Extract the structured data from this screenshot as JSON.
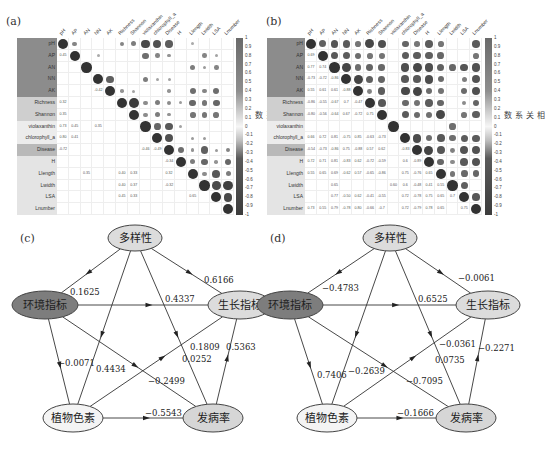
{
  "panels": {
    "a": {
      "label": "(a)"
    },
    "b": {
      "label": "(b)"
    },
    "c": {
      "label": "(c)"
    },
    "d": {
      "label": "(d)"
    }
  },
  "heatmap": {
    "variables": [
      "pH",
      "AP",
      "AN",
      "NN",
      "AK",
      "Richness",
      "Shannon",
      "violaxanthin",
      "chlorophyll_a",
      "Disease",
      "H",
      "Llength",
      "Lwidth",
      "LSA",
      "Lnumber"
    ],
    "row_groups": [
      {
        "rows": [
          0,
          1,
          2,
          3,
          4
        ],
        "color": "#8c8c8c"
      },
      {
        "rows": [
          5,
          6
        ],
        "color": "#cfcfcf"
      },
      {
        "rows": [
          7,
          8
        ],
        "color": "#ececec"
      },
      {
        "rows": [
          9
        ],
        "color": "#b9b9b9"
      },
      {
        "rows": [
          10,
          11,
          12,
          13,
          14
        ],
        "color": "#e4e4e4"
      }
    ],
    "colorbar": {
      "title": "相关系数",
      "ticks": [
        "1",
        "0.9",
        "0.8",
        "0.7",
        "0.6",
        "0.5",
        "0.4",
        "0.3",
        "0.2",
        "0.1",
        "0",
        "-0.1",
        "-0.2",
        "-0.3",
        "-0.4",
        "-0.5",
        "-0.6",
        "-0.7",
        "-0.8",
        "-0.9",
        "-1"
      ]
    }
  },
  "chart_data": [
    {
      "type": "heatmap",
      "title": "(a) correlation matrix",
      "variables": [
        "pH",
        "AP",
        "AN",
        "NN",
        "AK",
        "Richness",
        "Shannon",
        "violaxanthin",
        "chlorophyll_a",
        "Disease",
        "H",
        "Llength",
        "Lwidth",
        "LSA",
        "Lnumber"
      ],
      "legend": "相关系数",
      "range": [
        -1,
        1
      ],
      "upper_circles": [
        [
          0,
          0,
          1.0
        ],
        [
          0,
          1,
          0.45
        ],
        [
          0,
          5,
          0.45
        ],
        [
          0,
          6,
          0.5
        ],
        [
          0,
          7,
          0.85
        ],
        [
          0,
          8,
          0.8
        ],
        [
          0,
          9,
          -0.72
        ],
        [
          0,
          11,
          0.2
        ],
        [
          1,
          1,
          1.0
        ],
        [
          1,
          3,
          0.2
        ],
        [
          1,
          7,
          0.6
        ],
        [
          1,
          8,
          0.45
        ],
        [
          1,
          9,
          0.35
        ],
        [
          1,
          12,
          0.45
        ],
        [
          1,
          13,
          0.25
        ],
        [
          2,
          2,
          1.0
        ],
        [
          2,
          11,
          0.5
        ],
        [
          2,
          12,
          0.3
        ],
        [
          2,
          13,
          0.45
        ],
        [
          3,
          3,
          1.0
        ],
        [
          3,
          4,
          -0.7
        ],
        [
          3,
          7,
          0.5
        ],
        [
          3,
          8,
          0.25
        ],
        [
          3,
          9,
          0.25
        ],
        [
          4,
          4,
          1.0
        ],
        [
          4,
          5,
          0.35
        ],
        [
          4,
          6,
          0.25
        ],
        [
          4,
          9,
          0.35
        ],
        [
          4,
          11,
          0.6
        ],
        [
          4,
          12,
          0.45
        ],
        [
          4,
          13,
          0.6
        ],
        [
          5,
          5,
          1.0
        ],
        [
          5,
          6,
          0.95
        ],
        [
          5,
          7,
          0.4
        ],
        [
          5,
          8,
          0.5
        ],
        [
          5,
          9,
          0.4
        ],
        [
          5,
          10,
          0.3
        ],
        [
          5,
          11,
          0.65
        ],
        [
          5,
          12,
          0.55
        ],
        [
          5,
          13,
          0.65
        ],
        [
          6,
          6,
          1.0
        ],
        [
          6,
          7,
          0.4
        ],
        [
          6,
          8,
          0.5
        ],
        [
          6,
          9,
          0.35
        ],
        [
          6,
          11,
          0.55
        ],
        [
          6,
          12,
          0.55
        ],
        [
          6,
          13,
          0.55
        ],
        [
          7,
          7,
          1.0
        ],
        [
          7,
          8,
          0.65
        ],
        [
          7,
          9,
          -0.75
        ],
        [
          7,
          10,
          0.25
        ],
        [
          8,
          8,
          1.0
        ],
        [
          8,
          9,
          -0.8
        ],
        [
          8,
          11,
          0.3
        ],
        [
          8,
          12,
          0.3
        ],
        [
          9,
          9,
          1.0
        ],
        [
          9,
          10,
          0.6
        ],
        [
          9,
          11,
          0.35
        ],
        [
          9,
          12,
          -0.7
        ],
        [
          9,
          13,
          0.3
        ],
        [
          9,
          14,
          0.45
        ],
        [
          10,
          10,
          1.0
        ],
        [
          10,
          11,
          0.5
        ],
        [
          10,
          12,
          -0.65
        ],
        [
          10,
          13,
          0.35
        ],
        [
          10,
          14,
          0.65
        ],
        [
          11,
          11,
          1.0
        ],
        [
          11,
          12,
          0.4
        ],
        [
          11,
          13,
          0.75
        ],
        [
          11,
          14,
          0.5
        ],
        [
          12,
          12,
          1.0
        ],
        [
          12,
          13,
          0.83
        ],
        [
          12,
          14,
          -0.9
        ],
        [
          13,
          13,
          1.0
        ],
        [
          13,
          14,
          0.85
        ],
        [
          14,
          14,
          1.0
        ]
      ],
      "lower_values": [
        [
          1,
          0,
          "0.45"
        ],
        [
          4,
          3,
          "-0.42"
        ],
        [
          5,
          0,
          "0.32"
        ],
        [
          6,
          0,
          "0.35"
        ],
        [
          7,
          0,
          "0.73"
        ],
        [
          7,
          1,
          "0.45"
        ],
        [
          7,
          3,
          "0.35"
        ],
        [
          8,
          0,
          "0.80"
        ],
        [
          8,
          1,
          "0.41"
        ],
        [
          9,
          0,
          "-0.72"
        ],
        [
          9,
          7,
          "-0.46"
        ],
        [
          9,
          8,
          "-0.49"
        ],
        [
          10,
          9,
          "-0.34"
        ],
        [
          11,
          2,
          "0.35"
        ],
        [
          11,
          5,
          "0.40"
        ],
        [
          11,
          6,
          "0.33"
        ],
        [
          11,
          9,
          "0.32"
        ],
        [
          12,
          5,
          "0.40"
        ],
        [
          12,
          6,
          "0.37"
        ],
        [
          12,
          9,
          "-0.32"
        ],
        [
          13,
          5,
          "0.45"
        ],
        [
          13,
          6,
          "0.33"
        ],
        [
          13,
          11,
          "0.65"
        ]
      ]
    },
    {
      "type": "heatmap",
      "title": "(b) correlation matrix",
      "variables": [
        "pH",
        "AP",
        "AN",
        "NN",
        "AK",
        "Richness",
        "Shannon",
        "violaxanthin",
        "chlorophyll_a",
        "Disease",
        "H",
        "Llength",
        "Lwidth",
        "LSA",
        "Lnumber"
      ],
      "legend": "相关系数",
      "range": [
        -1,
        1
      ],
      "lower_values": [
        [
          1,
          0,
          "0.69"
        ],
        [
          2,
          0,
          "0.77"
        ],
        [
          2,
          1,
          "0.74"
        ],
        [
          3,
          0,
          "-0.73"
        ],
        [
          3,
          1,
          "-0.72"
        ],
        [
          3,
          2,
          "-0.86"
        ],
        [
          4,
          0,
          "0.55"
        ],
        [
          4,
          1,
          "0.61"
        ],
        [
          4,
          2,
          "0.61"
        ],
        [
          4,
          3,
          "-0.88"
        ],
        [
          5,
          0,
          "-0.86"
        ],
        [
          5,
          1,
          "-0.55"
        ],
        [
          5,
          2,
          "-0.67"
        ],
        [
          5,
          3,
          "0.7"
        ],
        [
          5,
          4,
          "-0.47"
        ],
        [
          6,
          0,
          "-0.80"
        ],
        [
          6,
          1,
          "-0.56"
        ],
        [
          6,
          2,
          "-0.64"
        ],
        [
          6,
          3,
          "0.67"
        ],
        [
          6,
          4,
          "-0.72"
        ],
        [
          6,
          5,
          "0.75"
        ],
        [
          8,
          0,
          "0.66"
        ],
        [
          8,
          1,
          "0.72"
        ],
        [
          8,
          2,
          "0.81"
        ],
        [
          8,
          3,
          "-0.75"
        ],
        [
          8,
          4,
          "0.85"
        ],
        [
          8,
          5,
          "-0.63"
        ],
        [
          8,
          6,
          "-0.73"
        ],
        [
          9,
          0,
          "-0.54"
        ],
        [
          9,
          1,
          "-0.73"
        ],
        [
          9,
          2,
          "-0.86"
        ],
        [
          9,
          3,
          "0.75"
        ],
        [
          9,
          4,
          "-0.88"
        ],
        [
          9,
          5,
          "0.57"
        ],
        [
          9,
          6,
          "0.62"
        ],
        [
          9,
          8,
          "-0.83"
        ],
        [
          10,
          0,
          "0.72"
        ],
        [
          10,
          1,
          "0.71"
        ],
        [
          10,
          2,
          "0.81"
        ],
        [
          10,
          3,
          "-0.83"
        ],
        [
          10,
          4,
          "0.62"
        ],
        [
          10,
          5,
          "-0.72"
        ],
        [
          10,
          6,
          "-0.59"
        ],
        [
          10,
          8,
          "0.6"
        ],
        [
          10,
          9,
          "-0.89"
        ],
        [
          11,
          0,
          "0.55"
        ],
        [
          11,
          1,
          "0.65"
        ],
        [
          11,
          2,
          "0.69"
        ],
        [
          11,
          3,
          "-0.62"
        ],
        [
          11,
          4,
          "0.57"
        ],
        [
          11,
          5,
          "-0.65"
        ],
        [
          11,
          6,
          "-0.86"
        ],
        [
          11,
          8,
          "0.75"
        ],
        [
          11,
          9,
          "-0.76"
        ],
        [
          11,
          10,
          "0.65"
        ],
        [
          12,
          2,
          "0.65"
        ],
        [
          12,
          7,
          "0.60"
        ],
        [
          12,
          8,
          "0.6"
        ],
        [
          12,
          9,
          "-0.48"
        ],
        [
          12,
          10,
          "0.41"
        ],
        [
          12,
          11,
          "0.55"
        ],
        [
          13,
          2,
          "0.77"
        ],
        [
          13,
          3,
          "-0.50"
        ],
        [
          13,
          4,
          "0.62"
        ],
        [
          13,
          5,
          "-0.41"
        ],
        [
          13,
          6,
          "-0.55"
        ],
        [
          13,
          8,
          "0.72"
        ],
        [
          13,
          9,
          "-0.78"
        ],
        [
          13,
          10,
          "0.75"
        ],
        [
          13,
          11,
          "0.65"
        ],
        [
          13,
          12,
          "0.7"
        ],
        [
          14,
          0,
          "0.73"
        ],
        [
          14,
          1,
          "0.55"
        ],
        [
          14,
          2,
          "0.79"
        ],
        [
          14,
          3,
          "-0.78"
        ],
        [
          14,
          4,
          "0.80"
        ],
        [
          14,
          5,
          "-0.66"
        ],
        [
          14,
          6,
          "-0.7"
        ],
        [
          14,
          8,
          "0.72"
        ],
        [
          14,
          9,
          "-0.79"
        ],
        [
          14,
          10,
          "0.78"
        ],
        [
          14,
          11,
          "0.65"
        ],
        [
          14,
          13,
          "0.75"
        ]
      ]
    }
  ],
  "diagrams": {
    "c": {
      "nodes": [
        {
          "id": "div",
          "label": "多样性",
          "cx": 135,
          "cy": 238,
          "rx": 27,
          "ry": 13,
          "fill": "#dcdcdc"
        },
        {
          "id": "env",
          "label": "环境指标",
          "cx": 45,
          "cy": 305,
          "rx": 33,
          "ry": 14,
          "fill": "#7d7d7d"
        },
        {
          "id": "grow",
          "label": "生长指标",
          "cx": 240,
          "cy": 305,
          "rx": 32,
          "ry": 14,
          "fill": "#dcdcdc"
        },
        {
          "id": "pig",
          "label": "植物色素",
          "cx": 73,
          "cy": 418,
          "rx": 30,
          "ry": 14,
          "fill": "#f4f4f4"
        },
        {
          "id": "dis",
          "label": "发病率",
          "cx": 213,
          "cy": 418,
          "rx": 30,
          "ry": 14,
          "fill": "#d6d6d6"
        }
      ],
      "edges": [
        {
          "from": "div",
          "to": "env",
          "value": "0.1625",
          "lx": 70,
          "ly": 295
        },
        {
          "from": "div",
          "to": "grow",
          "value": "0.6166",
          "lx": 204,
          "ly": 283
        },
        {
          "from": "env",
          "to": "grow",
          "value": "0.4337",
          "lx": 165,
          "ly": 302
        },
        {
          "from": "env",
          "to": "pig",
          "value": "-0.0071",
          "lx": 58,
          "ly": 366
        },
        {
          "from": "div",
          "to": "pig",
          "value": "0.4434",
          "lx": 96,
          "ly": 372
        },
        {
          "from": "env",
          "to": "dis",
          "value": "-0.2499",
          "lx": 148,
          "ly": 384
        },
        {
          "from": "pig",
          "to": "grow",
          "value": "0.1809",
          "lx": 190,
          "ly": 350
        },
        {
          "from": "div",
          "to": "dis",
          "value": "0.0252",
          "lx": 182,
          "ly": 362
        },
        {
          "from": "dis",
          "to": "grow",
          "value": "0.5363",
          "lx": 226,
          "ly": 350
        },
        {
          "from": "pig",
          "to": "dis",
          "value": "-0.5543",
          "lx": 145,
          "ly": 416
        }
      ]
    },
    "d": {
      "nodes": [
        {
          "id": "div",
          "label": "多样性",
          "cx": 390,
          "cy": 238,
          "rx": 27,
          "ry": 13,
          "fill": "#dcdcdc"
        },
        {
          "id": "env",
          "label": "环境指标",
          "cx": 290,
          "cy": 305,
          "rx": 33,
          "ry": 14,
          "fill": "#7d7d7d"
        },
        {
          "id": "grow",
          "label": "生长指标",
          "cx": 488,
          "cy": 305,
          "rx": 32,
          "ry": 14,
          "fill": "#dcdcdc"
        },
        {
          "id": "pig",
          "label": "植物色素",
          "cx": 327,
          "cy": 418,
          "rx": 30,
          "ry": 14,
          "fill": "#f4f4f4"
        },
        {
          "id": "dis",
          "label": "发病率",
          "cx": 466,
          "cy": 418,
          "rx": 30,
          "ry": 14,
          "fill": "#d6d6d6"
        }
      ],
      "edges": [
        {
          "from": "div",
          "to": "env",
          "value": "-0.4783",
          "lx": 322,
          "ly": 291
        },
        {
          "from": "div",
          "to": "grow",
          "value": "-0.0061",
          "lx": 458,
          "ly": 281
        },
        {
          "from": "env",
          "to": "grow",
          "value": "0.6525",
          "lx": 418,
          "ly": 302
        },
        {
          "from": "env",
          "to": "pig",
          "value": "0.7406",
          "lx": 317,
          "ly": 378
        },
        {
          "from": "div",
          "to": "pig",
          "value": "-0.2639",
          "lx": 348,
          "ly": 374
        },
        {
          "from": "env",
          "to": "dis",
          "value": "-0.7095",
          "lx": 406,
          "ly": 384
        },
        {
          "from": "pig",
          "to": "grow",
          "value": "-0.0361",
          "lx": 439,
          "ly": 347
        },
        {
          "from": "div",
          "to": "dis",
          "value": "0.0735",
          "lx": 435,
          "ly": 363
        },
        {
          "from": "dis",
          "to": "grow",
          "value": "-0.2271",
          "lx": 478,
          "ly": 351
        },
        {
          "from": "pig",
          "to": "dis",
          "value": "-0.1666",
          "lx": 397,
          "ly": 416
        }
      ]
    }
  }
}
